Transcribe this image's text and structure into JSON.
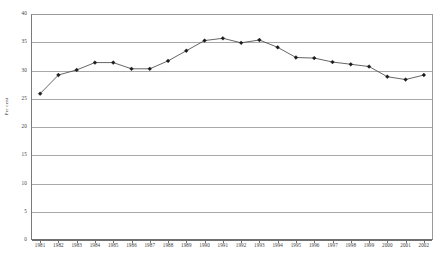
{
  "chart_data": {
    "type": "line",
    "title": "",
    "xlabel": "",
    "ylabel": "Per cent",
    "ylim": [
      0,
      40
    ],
    "yticks": [
      0,
      5,
      10,
      15,
      20,
      25,
      30,
      35,
      40
    ],
    "grid": "horizontal",
    "legend": "none",
    "marker": "filled-diamond",
    "categories": [
      "1981",
      "1982",
      "1983",
      "1984",
      "1985",
      "1986",
      "1987",
      "1988",
      "1989",
      "1990",
      "1991",
      "1992",
      "1993",
      "1994",
      "1995",
      "1996",
      "1997",
      "1998",
      "1999",
      "2000",
      "2001",
      "2002"
    ],
    "values": [
      25.9,
      29.2,
      30.1,
      31.4,
      31.4,
      30.3,
      30.3,
      31.7,
      33.5,
      35.3,
      35.7,
      34.9,
      35.4,
      34.1,
      32.3,
      32.2,
      31.5,
      31.1,
      30.7,
      28.9,
      28.4,
      29.2
    ],
    "series": [
      {
        "name": "Per cent",
        "values": [
          25.9,
          29.2,
          30.1,
          31.4,
          31.4,
          30.3,
          30.3,
          31.7,
          33.5,
          35.3,
          35.7,
          34.9,
          35.4,
          34.1,
          32.3,
          32.2,
          31.5,
          31.1,
          30.7,
          28.9,
          28.4,
          29.2
        ]
      }
    ],
    "colors": {
      "line": "#4a4a4a",
      "marker": "#1a1a1a",
      "grid": "#a8a8a8",
      "axis": "#6f6f6f",
      "background": "#ffffff",
      "text": "#3a3a3a"
    }
  }
}
